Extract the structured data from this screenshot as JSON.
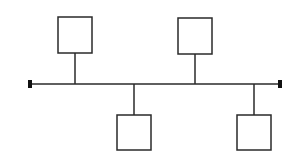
{
  "diagram": {
    "type": "bus-topology",
    "colors": {
      "stroke": "#2a2a2a",
      "terminator": "#111111",
      "background": "#ffffff"
    },
    "bus": {
      "y": 84,
      "x1": 30,
      "x2": 280
    },
    "terminators": [
      {
        "name": "left-terminator",
        "x": 28,
        "y": 80,
        "w": 4,
        "h": 8
      },
      {
        "name": "right-terminator",
        "x": 278,
        "y": 80,
        "w": 4,
        "h": 8
      }
    ],
    "nodes": [
      {
        "name": "node-1",
        "position": "above",
        "x": 58,
        "y": 17,
        "w": 34,
        "h": 36,
        "stem_x": 75
      },
      {
        "name": "node-2",
        "position": "above",
        "x": 178,
        "y": 18,
        "w": 34,
        "h": 36,
        "stem_x": 195
      },
      {
        "name": "node-3",
        "position": "below",
        "x": 117,
        "y": 115,
        "w": 34,
        "h": 35,
        "stem_x": 134
      },
      {
        "name": "node-4",
        "position": "below",
        "x": 237,
        "y": 115,
        "w": 34,
        "h": 35,
        "stem_x": 254
      }
    ]
  }
}
